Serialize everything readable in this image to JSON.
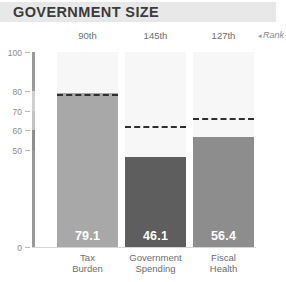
{
  "header": {
    "title": "GOVERNMENT SIZE"
  },
  "rank_row": {
    "caption": "Rank",
    "caption_arrow": "◂",
    "ranks": [
      "90th",
      "145th",
      "127th"
    ]
  },
  "axis": {
    "y_ticks": [
      "100",
      "80",
      "70",
      "60",
      "50",
      "0"
    ],
    "y_tick_values": [
      100,
      80,
      70,
      60,
      50,
      0
    ],
    "ymin": 0,
    "ymax": 100
  },
  "colors": {
    "title_band": "#e8e8e8",
    "title_text": "#3b3b3b",
    "bar_light": "#a8a8a8",
    "bar_dark": "#5e5e5e",
    "background_column": "#f7f7f7",
    "dashed_line": "#2f2f2f",
    "tick_text": "#8d8d8d",
    "category_text": "#6d6d6d"
  },
  "chart_data": {
    "type": "bar",
    "title": "GOVERNMENT SIZE",
    "xlabel": "",
    "ylabel": "",
    "ylim": [
      0,
      100
    ],
    "yticks": [
      0,
      50,
      60,
      70,
      80,
      100
    ],
    "grid": false,
    "legend": "none",
    "categories": [
      "Tax Burden",
      "Government Spending",
      "Fiscal Health"
    ],
    "values": [
      79.1,
      46.1,
      56.4
    ],
    "value_labels": [
      "79.1",
      "46.1",
      "56.4"
    ],
    "ranks": [
      "90th",
      "145th",
      "127th"
    ],
    "series": [
      {
        "name": "Score",
        "values": [
          79.1,
          46.1,
          56.4
        ]
      },
      {
        "name": "World Average",
        "type": "dashed-line-marker",
        "values": [
          78.0,
          62.0,
          66.0
        ]
      }
    ],
    "annotations": [
      {
        "text": "Rank",
        "position": "top-right"
      }
    ]
  }
}
